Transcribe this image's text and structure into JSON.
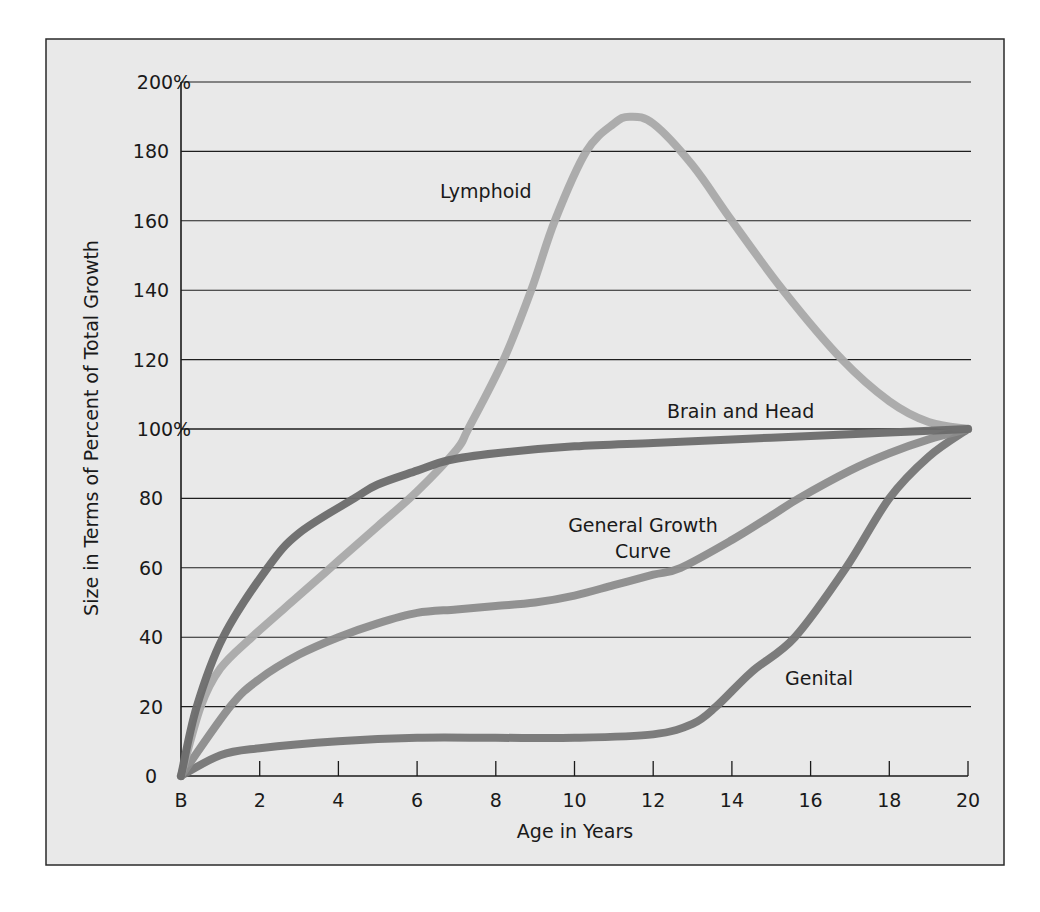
{
  "chart_data": {
    "type": "line",
    "title": "",
    "xlabel": "Age in Years",
    "ylabel": "Size in Terms of Percent of Total Growth",
    "xlim": [
      0,
      20
    ],
    "ylim": [
      0,
      200
    ],
    "grid": "horizontal",
    "legend": "inline labels",
    "x_ticks": [
      {
        "value": 0,
        "label": "B"
      },
      {
        "value": 2,
        "label": "2"
      },
      {
        "value": 4,
        "label": "4"
      },
      {
        "value": 6,
        "label": "6"
      },
      {
        "value": 8,
        "label": "8"
      },
      {
        "value": 10,
        "label": "10"
      },
      {
        "value": 12,
        "label": "12"
      },
      {
        "value": 14,
        "label": "14"
      },
      {
        "value": 16,
        "label": "16"
      },
      {
        "value": 18,
        "label": "18"
      },
      {
        "value": 20,
        "label": "20"
      }
    ],
    "y_ticks": [
      {
        "value": 0,
        "label": "0"
      },
      {
        "value": 20,
        "label": "20"
      },
      {
        "value": 40,
        "label": "40"
      },
      {
        "value": 60,
        "label": "60"
      },
      {
        "value": 80,
        "label": "80"
      },
      {
        "value": 100,
        "label": "100%"
      },
      {
        "value": 120,
        "label": "120"
      },
      {
        "value": 140,
        "label": "140"
      },
      {
        "value": 160,
        "label": "160"
      },
      {
        "value": 180,
        "label": "180"
      },
      {
        "value": 200,
        "label": "200%"
      }
    ],
    "series": [
      {
        "name": "Lymphoid",
        "color": "#a9a9a9",
        "x": [
          0,
          0.5,
          1,
          1.8,
          3,
          4,
          5,
          6,
          7,
          7.3,
          8.2,
          8.9,
          9.5,
          10.3,
          11,
          11.4,
          12,
          13,
          14,
          15.3,
          16.8,
          18,
          19,
          20
        ],
        "y": [
          0,
          20,
          31,
          40,
          52,
          62,
          72,
          82,
          94,
          100,
          120,
          140,
          160,
          180,
          188,
          190,
          188,
          176,
          160,
          140,
          120,
          108,
          102,
          100
        ]
      },
      {
        "name": "Brain and Head",
        "color": "#6b6b6b",
        "x": [
          0,
          0.4,
          1.07,
          2.2,
          3,
          4.4,
          5,
          6,
          6.8,
          8,
          10,
          12,
          14,
          16,
          18,
          20
        ],
        "y": [
          0,
          20,
          40,
          60,
          70,
          80,
          84,
          88,
          91,
          93,
          95,
          96,
          97,
          98,
          99,
          100
        ]
      },
      {
        "name": "General Growth Curve",
        "color": "#8c8c8c",
        "x": [
          0,
          1.25,
          2,
          3,
          4,
          5,
          6,
          7,
          8,
          9,
          10,
          11,
          12,
          12.7,
          14,
          15,
          15.7,
          17,
          18,
          19,
          20
        ],
        "y": [
          0,
          20,
          28,
          35,
          40,
          44,
          47,
          48,
          49,
          50,
          52,
          55,
          58,
          60,
          68,
          75,
          80,
          88,
          93,
          97,
          100
        ]
      },
      {
        "name": "Genital",
        "color": "#767676",
        "x": [
          0,
          1,
          2,
          4,
          6,
          8,
          10,
          12,
          13,
          13.6,
          14.5,
          15.6,
          16.9,
          18,
          19,
          20
        ],
        "y": [
          0,
          6,
          8,
          10,
          11,
          11,
          11,
          12,
          15,
          20,
          30,
          40,
          60,
          80,
          92,
          100
        ]
      }
    ],
    "annotations": [
      {
        "text": "Lymphoid",
        "x": 9.3,
        "y": 170
      },
      {
        "text": "Brain and Head",
        "x": 16.1,
        "y": 104
      },
      {
        "text": "General Growth",
        "x": 11.7,
        "y": 73
      },
      {
        "text": "Curve",
        "x": 11.7,
        "y": 65
      },
      {
        "text": "Genital",
        "x": 16.8,
        "y": 28
      }
    ]
  },
  "labels": {
    "lymphoid": "Lymphoid",
    "brain": "Brain and Head",
    "general_line1": "General Growth",
    "general_line2": "Curve",
    "genital": "Genital",
    "xlabel": "Age in Years",
    "ylabel": "Size in Terms of Percent of Total Growth"
  },
  "style": {
    "background": "#e9e9e9",
    "frame_color": "#2a2a2a",
    "grid_color": "#1e1e1e"
  }
}
